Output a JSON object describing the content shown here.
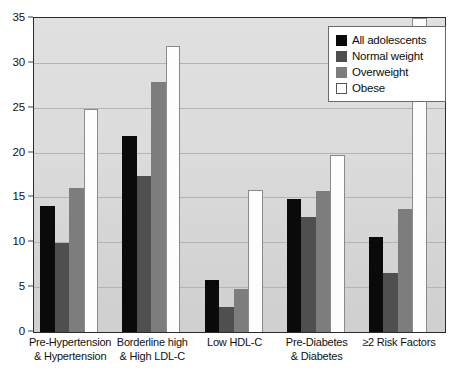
{
  "chart_data": {
    "type": "bar",
    "title": "",
    "xlabel": "",
    "ylabel": "",
    "ylim": [
      0,
      35
    ],
    "yticks": [
      0,
      5,
      10,
      15,
      20,
      25,
      30,
      35
    ],
    "ytick_labels": [
      "0",
      "5",
      "10",
      "15",
      "20",
      "25",
      "30",
      "35"
    ],
    "grid": true,
    "legend_position": "top-right",
    "categories": [
      "Pre-Hypertension & Hypertension",
      "Borderline high & High LDL-C",
      "Low HDL-C",
      "Pre-Diabetes & Diabetes",
      "≥2 Risk Factors"
    ],
    "category_lines": [
      [
        "Pre-Hypertension",
        "& Hypertension"
      ],
      [
        "Borderline high",
        "& High LDL-C"
      ],
      [
        "Low HDL-C",
        ""
      ],
      [
        "Pre-Diabetes",
        "& Diabetes"
      ],
      [
        "≥2 Risk Factors",
        ""
      ]
    ],
    "series": [
      {
        "name": "All adolescents",
        "color": "#0a0a0a",
        "values": [
          14.0,
          21.9,
          5.8,
          14.8,
          10.6
        ]
      },
      {
        "name": "Normal weight",
        "color": "#4f4f4f",
        "values": [
          9.9,
          17.4,
          2.8,
          12.8,
          6.6
        ]
      },
      {
        "name": "Overweight",
        "color": "#7d7d7d",
        "values": [
          16.0,
          27.9,
          4.8,
          15.7,
          13.7
        ]
      },
      {
        "name": "Obese",
        "color": "#ffffff",
        "values": [
          24.9,
          31.9,
          15.8,
          19.7,
          35.0
        ]
      }
    ]
  },
  "legend": {
    "entries": [
      {
        "label": "All adolescents"
      },
      {
        "label": "Normal weight"
      },
      {
        "label": "Overweight"
      },
      {
        "label": "Obese"
      }
    ]
  }
}
